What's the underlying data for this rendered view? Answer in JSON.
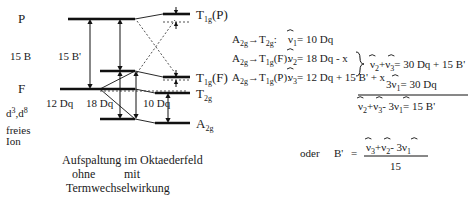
{
  "figure": {
    "caption_line1": "Aufspaltung im Oktaederfeld",
    "caption_ohne": "ohne",
    "caption_mit": "mit",
    "caption_line3": "Termwechselwirkung"
  },
  "diagram": {
    "free_ion": {
      "config_label": "d",
      "config_sup1": "3",
      "config_mid": ",d",
      "config_sup2": "8",
      "line1": "freies",
      "line2": "Ion",
      "term_P": "P",
      "term_F": "F"
    },
    "gap_labels": {
      "fifteen_B": "15 B",
      "fifteen_Bprime": "15 B'",
      "twelve_Dq": "12 Dq",
      "eighteen_Dq": "18 Dq",
      "ten_Dq": "10 Dq"
    },
    "terms": [
      {
        "label": "T",
        "sub": "1g",
        "paren": "(P)"
      },
      {
        "label": "T",
        "sub": "1g",
        "paren": "(F)"
      },
      {
        "label": "T",
        "sub": "2g",
        "paren": ""
      },
      {
        "label": "A",
        "sub": "2g",
        "paren": ""
      }
    ]
  },
  "equations": {
    "transitions": [
      {
        "from": "A",
        "from_sub": "2g",
        "arrow": "→",
        "to": "T",
        "to_sub": "2g",
        "to_paren": ":"
      },
      {
        "from": "A",
        "from_sub": "2g",
        "arrow": "→",
        "to": "T",
        "to_sub": "1g",
        "to_paren": "(F):"
      },
      {
        "from": "A",
        "from_sub": "2g",
        "arrow": "→",
        "to": "T",
        "to_sub": "1g",
        "to_paren": "(P):"
      }
    ],
    "nu_symbol": "ν",
    "nu_lines": [
      {
        "sub": "1",
        "rhs": "= 10 Dq"
      },
      {
        "sub": "2",
        "rhs": "= 18 Dq - x"
      },
      {
        "sub": "3",
        "rhs": "= 12 Dq + 15 B' + x"
      }
    ],
    "sum_line": "+",
    "sum_eq": "= 30 Dq + 15 B'",
    "three_nu_prefix": "3",
    "three_nu_eq": "= 30 Dq",
    "result_eq": "= 15 B'",
    "result_minus": "- 3",
    "oder": "oder",
    "bprime": "B'",
    "equals": "=",
    "fraction_denominator": "15",
    "frac_minus": "- 3"
  }
}
